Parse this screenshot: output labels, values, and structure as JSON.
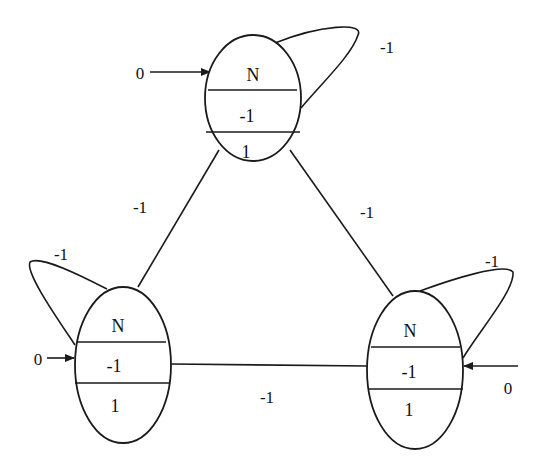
{
  "diagram": {
    "type": "state-graph",
    "colors": {
      "stroke": "#1a1a1a",
      "background": "#ffffff",
      "text": "#111111"
    },
    "nodes": [
      {
        "id": "top",
        "rows": [
          "N",
          "-1",
          "1"
        ],
        "input_label": "0",
        "self_loop_label": "-1"
      },
      {
        "id": "left",
        "rows": [
          "N",
          "-1",
          "1"
        ],
        "input_label": "0",
        "self_loop_label": "-1"
      },
      {
        "id": "right",
        "rows": [
          "N",
          "-1",
          "1"
        ],
        "input_label": "0",
        "self_loop_label": "-1"
      }
    ],
    "edges": [
      {
        "from": "top",
        "to": "left",
        "label": "-1"
      },
      {
        "from": "top",
        "to": "right",
        "label": "-1"
      },
      {
        "from": "left",
        "to": "right",
        "label": "-1"
      }
    ]
  }
}
